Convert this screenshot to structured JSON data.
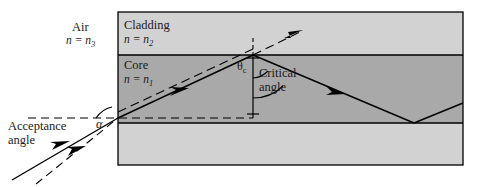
{
  "figure": {
    "labels": {
      "air": "Air",
      "air_index": "n = n",
      "air_index_sub": "3",
      "cladding": "Cladding",
      "cladding_index": "n = n",
      "cladding_index_sub": "2",
      "core": "Core",
      "core_index": "n = n",
      "core_index_sub": "1",
      "theta": "θ",
      "theta_sub": "c",
      "critical_line1": "Critical",
      "critical_line2": "angle",
      "acceptance_line1": "Acceptance",
      "acceptance_line2": "angle",
      "alpha": "α"
    },
    "colors": {
      "cladding_fill": "#d2d2d2",
      "core_fill": "#a9a9a9",
      "outline": "#000000",
      "ray": "#000000",
      "background": "#ffffff"
    },
    "geometry": {
      "box": {
        "x": 118,
        "y": 12,
        "width": 345,
        "height": 153
      },
      "cladding_top": {
        "y_top": 12,
        "y_bottom": 55
      },
      "core": {
        "y_top": 55,
        "y_bottom": 123
      },
      "cladding_bottom": {
        "y_top": 123,
        "y_bottom": 165
      },
      "entry_point": {
        "x": 118,
        "y": 118
      },
      "first_reflection": {
        "x": 253,
        "y": 55
      },
      "second_reflection": {
        "x": 414,
        "y": 123
      },
      "refracted_exit": {
        "x": 302,
        "y": 31
      },
      "normal_line_x": 253,
      "dashed_horizontal_y": 118
    }
  }
}
